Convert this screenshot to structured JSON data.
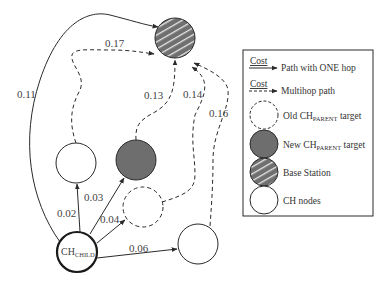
{
  "diagram": {
    "type": "network-routing",
    "nodes": [
      {
        "id": "base-station",
        "kind": "Base Station",
        "cx": 175,
        "cy": 38
      },
      {
        "id": "new-parent",
        "kind": "New CH_PARENT target",
        "cx": 136,
        "cy": 160
      },
      {
        "id": "ch-left",
        "kind": "CH nodes",
        "cx": 76,
        "cy": 163
      },
      {
        "id": "old-parent",
        "kind": "Old CH_PARENT target",
        "cx": 143,
        "cy": 207
      },
      {
        "id": "ch-right",
        "kind": "CH nodes",
        "cx": 198,
        "cy": 244
      },
      {
        "id": "ch-child",
        "kind": "CH_CHILD",
        "cx": 77,
        "cy": 252
      }
    ],
    "edges": [
      {
        "from": "ch-child",
        "to": "base-station",
        "cost": "0.11",
        "style": "solid"
      },
      {
        "from": "ch-left",
        "to": "base-station",
        "cost": "0.17",
        "style": "dashed"
      },
      {
        "from": "new-parent",
        "to": "base-station",
        "cost": "0.13",
        "style": "dashed"
      },
      {
        "from": "old-parent",
        "to": "base-station",
        "cost": "0.14",
        "style": "dashed"
      },
      {
        "from": "ch-right",
        "to": "base-station",
        "cost": "0.16",
        "style": "dashed"
      },
      {
        "from": "ch-child",
        "to": "ch-left",
        "cost": "0.02",
        "style": "solid"
      },
      {
        "from": "ch-child",
        "to": "new-parent",
        "cost": "0.03",
        "style": "solid"
      },
      {
        "from": "ch-child",
        "to": "old-parent",
        "cost": "0.04",
        "style": "solid"
      },
      {
        "from": "ch-child",
        "to": "ch-right",
        "cost": "0.06",
        "style": "solid"
      }
    ],
    "labels": {
      "e011": "0.11",
      "e017": "0.17",
      "e013": "0.13",
      "e014": "0.14",
      "e016": "0.16",
      "e002": "0.02",
      "e003": "0.03",
      "e004": "0.04",
      "e006": "0.06",
      "child_main": "CH",
      "child_sub": "CHILD"
    }
  },
  "legend": {
    "cost_word": "Cost",
    "one_hop": "Path with ONE hop",
    "multihop": "Multihop path",
    "old_parent_main": "Old CH",
    "old_parent_sub": "PARENT",
    "old_parent_tail": " target",
    "new_parent_main": "New CH",
    "new_parent_sub": "PARENT",
    "new_parent_tail": " target",
    "base_station": "Base Station",
    "ch_nodes": "CH nodes"
  },
  "colors": {
    "line": "#2a2a2a",
    "dark_fill": "#6e6e6e",
    "base_fill": "#707070",
    "stripe": "#e8e8e8"
  }
}
